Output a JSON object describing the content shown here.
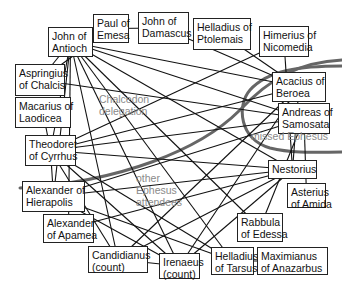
{
  "diagram": {
    "colors": {
      "edge": "#111111",
      "boundary": "#666666",
      "node_border": "#222222",
      "group_label": "#8a8a8a"
    },
    "nodes": [
      {
        "id": "john_antioch",
        "line1": "John of",
        "line2": "Antioch",
        "x": 48,
        "y": 27,
        "w": 45,
        "h": 30
      },
      {
        "id": "paul_emesa",
        "line1": "Paul of",
        "line2": "Emesa",
        "x": 93,
        "y": 14,
        "w": 36,
        "h": 29
      },
      {
        "id": "john_damascus",
        "line1": "John of",
        "line2": "Damascus",
        "x": 138,
        "y": 12,
        "w": 51,
        "h": 32
      },
      {
        "id": "helladius_ptolemais",
        "line1": "Helladius of",
        "line2": "Ptolemais",
        "x": 193,
        "y": 18,
        "w": 58,
        "h": 32
      },
      {
        "id": "himerius_nicomedia",
        "line1": "Himerius of",
        "line2": "Nicomedia",
        "x": 259,
        "y": 26,
        "w": 50,
        "h": 31
      },
      {
        "id": "aspringius_chalcis",
        "line1": "Aspringius",
        "line2": "of Chalcis",
        "x": 15,
        "y": 64,
        "w": 50,
        "h": 32
      },
      {
        "id": "macarius_laodicea",
        "line1": "Macarius of",
        "line2": "Laodicea",
        "x": 15,
        "y": 97,
        "w": 56,
        "h": 31
      },
      {
        "id": "theodoret_cyrrhus",
        "line1": "Theodoret",
        "line2": "of Cyrrhus",
        "x": 25,
        "y": 135,
        "w": 51,
        "h": 31
      },
      {
        "id": "acacius_beroea",
        "line1": "Acacius of",
        "line2": "Beroea",
        "x": 272,
        "y": 72,
        "w": 54,
        "h": 30
      },
      {
        "id": "andreas_samosata",
        "line1": "Andreas of",
        "line2": "Samosata",
        "x": 278,
        "y": 103,
        "w": 52,
        "h": 31
      },
      {
        "id": "nestorius",
        "line1": "Nestorius",
        "line2": "",
        "x": 268,
        "y": 160,
        "w": 49,
        "h": 19
      },
      {
        "id": "asterius_amida",
        "line1": "Asterius",
        "line2": "of Amida",
        "x": 287,
        "y": 183,
        "w": 39,
        "h": 25
      },
      {
        "id": "alexander_hierapolis",
        "line1": "Alexander of",
        "line2": "Hierapolis",
        "x": 22,
        "y": 181,
        "w": 63,
        "h": 31
      },
      {
        "id": "alexander_apamea",
        "line1": "Alexander",
        "line2": "of Apamea",
        "x": 43,
        "y": 214,
        "w": 51,
        "h": 29
      },
      {
        "id": "rabbula_edessa",
        "line1": "Rabbula",
        "line2": "of Edessa",
        "x": 237,
        "y": 213,
        "w": 46,
        "h": 29
      },
      {
        "id": "candidianus",
        "line1": "Candidianus",
        "line2": "(count)",
        "x": 88,
        "y": 246,
        "w": 60,
        "h": 27
      },
      {
        "id": "irenaeus",
        "line1": "Irenaeus",
        "line2": "(count)",
        "x": 159,
        "y": 253,
        "w": 41,
        "h": 26
      },
      {
        "id": "helladius_tarsus",
        "line1": "Helladius",
        "line2": "of Tarsus",
        "x": 211,
        "y": 247,
        "w": 43,
        "h": 28
      },
      {
        "id": "maximianus_anazarbus",
        "line1": "Maximianus",
        "line2": "of Anazarbus",
        "x": 257,
        "y": 247,
        "w": 71,
        "h": 28
      }
    ],
    "group_labels": [
      {
        "id": "chalcedon",
        "line1": "Chalcedon",
        "line2": "delegation",
        "x": 99,
        "y": 93
      },
      {
        "id": "missed_ephesus",
        "line1": "missed Ephesus",
        "line2": "",
        "x": 251,
        "y": 130
      },
      {
        "id": "other_ephesus",
        "line1": "other",
        "line2": "Ephesus",
        "line3": "attendees",
        "x": 136,
        "y": 172
      }
    ],
    "edges": [
      [
        "john_antioch",
        "paul_emesa"
      ],
      [
        "paul_emesa",
        "john_damascus"
      ],
      [
        "john_antioch",
        "aspringius_chalcis"
      ],
      [
        "john_antioch",
        "acacius_beroea"
      ],
      [
        "john_antioch",
        "andreas_samosata"
      ],
      [
        "john_antioch",
        "nestorius"
      ],
      [
        "john_antioch",
        "rabbula_edessa"
      ],
      [
        "john_antioch",
        "candidianus"
      ],
      [
        "john_antioch",
        "irenaeus"
      ],
      [
        "john_antioch",
        "helladius_tarsus"
      ],
      [
        "john_antioch",
        "theodoret_cyrrhus"
      ],
      [
        "john_antioch",
        "alexander_hierapolis"
      ],
      [
        "john_antioch",
        "alexander_apamea"
      ],
      [
        "john_damascus",
        "acacius_beroea"
      ],
      [
        "paul_emesa",
        "aspringius_chalcis"
      ],
      [
        "helladius_ptolemais",
        "acacius_beroea"
      ],
      [
        "himerius_nicomedia",
        "nestorius"
      ],
      [
        "himerius_nicomedia",
        "theodoret_cyrrhus"
      ],
      [
        "aspringius_chalcis",
        "andreas_samosata"
      ],
      [
        "macarius_laodicea",
        "theodoret_cyrrhus"
      ],
      [
        "theodoret_cyrrhus",
        "acacius_beroea"
      ],
      [
        "theodoret_cyrrhus",
        "andreas_samosata"
      ],
      [
        "theodoret_cyrrhus",
        "nestorius"
      ],
      [
        "theodoret_cyrrhus",
        "irenaeus"
      ],
      [
        "theodoret_cyrrhus",
        "helladius_tarsus"
      ],
      [
        "theodoret_cyrrhus",
        "candidianus"
      ],
      [
        "theodoret_cyrrhus",
        "alexander_hierapolis"
      ],
      [
        "alexander_hierapolis",
        "nestorius"
      ],
      [
        "alexander_hierapolis",
        "andreas_samosata"
      ],
      [
        "alexander_hierapolis",
        "helladius_tarsus"
      ],
      [
        "alexander_hierapolis",
        "irenaeus"
      ],
      [
        "alexander_apamea",
        "nestorius"
      ],
      [
        "acacius_beroea",
        "candidianus"
      ],
      [
        "acacius_beroea",
        "irenaeus"
      ],
      [
        "andreas_samosata",
        "rabbula_edessa"
      ],
      [
        "andreas_samosata",
        "asterius_amida"
      ],
      [
        "nestorius",
        "irenaeus"
      ],
      [
        "nestorius",
        "candidianus"
      ],
      [
        "candidianus",
        "irenaeus"
      ],
      [
        "helladius_tarsus",
        "maximianus_anazarbus"
      ],
      [
        "acacius_beroea",
        "nestorius"
      ]
    ]
  }
}
